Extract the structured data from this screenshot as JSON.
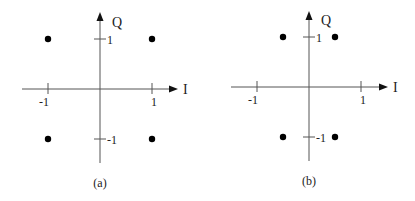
{
  "panels": [
    {
      "id": "a",
      "caption": "(a)",
      "axes": {
        "x_label": "I",
        "y_label": "Q",
        "x_ticks": [
          {
            "value": -1,
            "label": "-1"
          },
          {
            "value": 1,
            "label": "1"
          }
        ],
        "y_ticks": [
          {
            "value": 1,
            "label": "1"
          },
          {
            "value": -1,
            "label": "-1"
          }
        ]
      },
      "points": [
        {
          "i": -1,
          "q": 1
        },
        {
          "i": 1,
          "q": 1
        },
        {
          "i": -1,
          "q": -1
        },
        {
          "i": 1,
          "q": -1
        }
      ]
    },
    {
      "id": "b",
      "caption": "(b)",
      "axes": {
        "x_label": "I",
        "y_label": "Q",
        "x_ticks": [
          {
            "value": -1,
            "label": "-1"
          },
          {
            "value": 1,
            "label": "1"
          }
        ],
        "y_ticks": [
          {
            "value": 1,
            "label": "1"
          },
          {
            "value": -1,
            "label": "-1"
          }
        ]
      },
      "points": [
        {
          "i": -0.5,
          "q": 1
        },
        {
          "i": 0.5,
          "q": 1
        },
        {
          "i": -0.5,
          "q": -1
        },
        {
          "i": 0.5,
          "q": -1
        }
      ]
    }
  ],
  "colors": {
    "axis": "#555555",
    "point": "#000000",
    "text": "#222222"
  }
}
